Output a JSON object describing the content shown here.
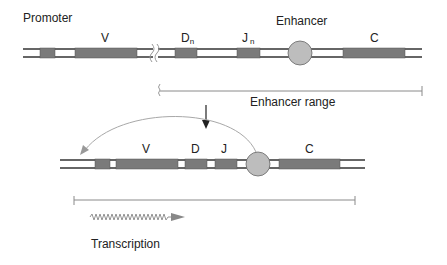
{
  "labels": {
    "promoter": "Promoter",
    "enhancer": "Enhancer",
    "enhancer_range": "Enhancer range",
    "transcription": "Transcription"
  },
  "top_segments": {
    "v": "V",
    "d": "D",
    "d_sub": "n",
    "j": "J",
    "j_sub": "n",
    "c": "C"
  },
  "bottom_segments": {
    "v": "V",
    "d": "D",
    "j": "J",
    "c": "C"
  },
  "colors": {
    "exon": "#7a7a7a",
    "enhancer": "#bdbdbd",
    "dna_line": "#333333",
    "range_line": "#8a8a8a",
    "arrow": "#222222",
    "curve": "#a0a0a0"
  }
}
